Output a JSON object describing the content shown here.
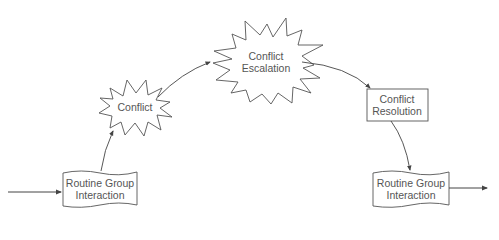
{
  "diagram": {
    "type": "flow",
    "colors": {
      "stroke": "#555555",
      "text": "#555555",
      "background": "#ffffff"
    },
    "nodes": [
      {
        "id": "routine-start",
        "shape": "document",
        "lines": [
          "Routine Group",
          "Interaction"
        ]
      },
      {
        "id": "conflict",
        "shape": "burst",
        "lines": [
          "Conflict"
        ]
      },
      {
        "id": "conflict-escalation",
        "shape": "burst",
        "lines": [
          "Conflict",
          "Escalation"
        ]
      },
      {
        "id": "conflict-resolution",
        "shape": "rectangle",
        "lines": [
          "Conflict",
          "Resolution"
        ]
      },
      {
        "id": "routine-end",
        "shape": "document",
        "lines": [
          "Routine Group",
          "Interaction"
        ]
      }
    ],
    "edges": [
      {
        "from": "input",
        "to": "routine-start"
      },
      {
        "from": "routine-start",
        "to": "conflict"
      },
      {
        "from": "conflict",
        "to": "conflict-escalation"
      },
      {
        "from": "conflict-escalation",
        "to": "conflict-resolution"
      },
      {
        "from": "conflict-resolution",
        "to": "routine-end"
      },
      {
        "from": "routine-end",
        "to": "output"
      }
    ]
  }
}
